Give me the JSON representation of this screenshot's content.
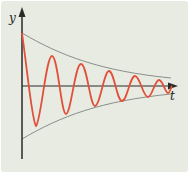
{
  "figure": {
    "y_axis_label": "y",
    "x_axis_label": "t",
    "colors": {
      "background": "#e8ebe2",
      "oscillation": "#e0503a",
      "envelope": "#8a8f8a",
      "axes": "#2a2a2a"
    }
  }
}
